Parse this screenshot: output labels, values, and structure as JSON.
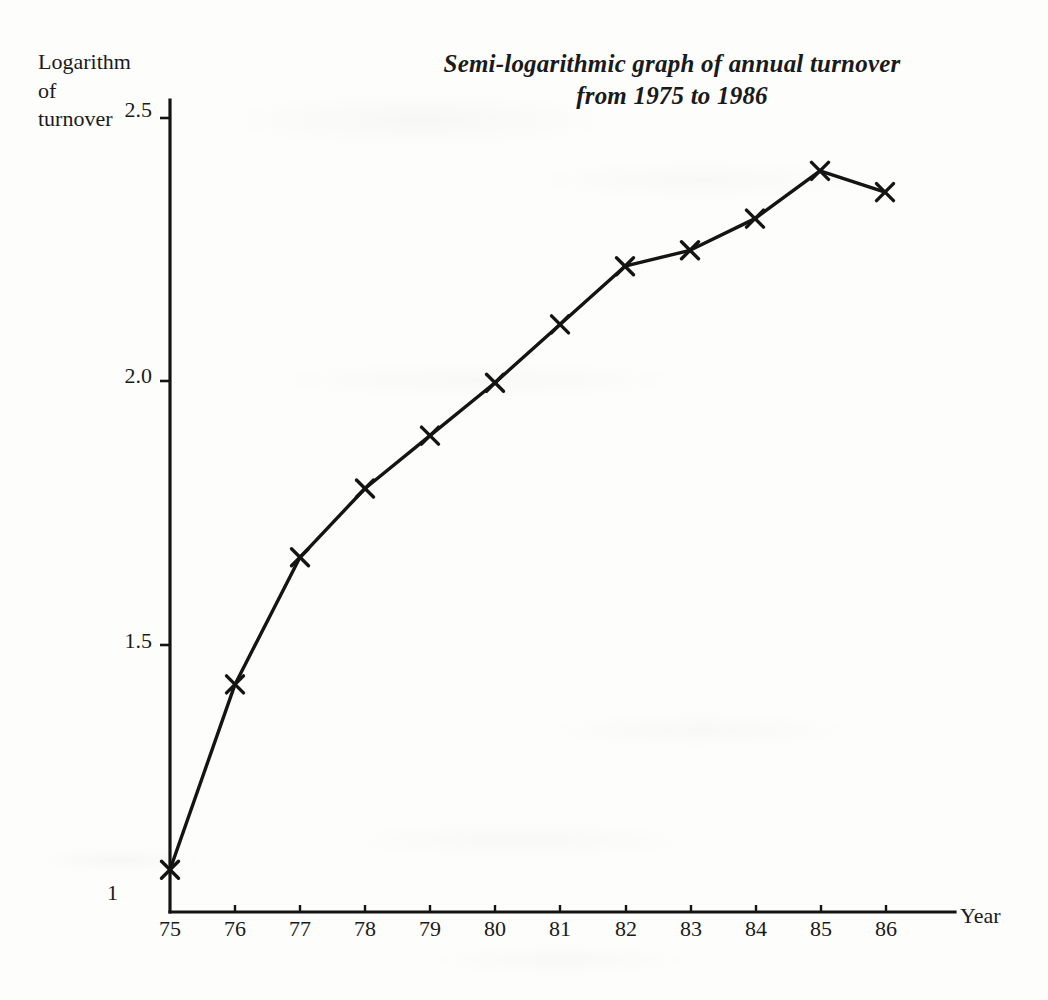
{
  "chart_data": {
    "type": "line",
    "title": "Semi-logarithmic graph of annual turnover from 1975 to 1986",
    "title_lines": [
      "Semi-logarithmic graph of annual turnover",
      "from 1975 to 1986"
    ],
    "xlabel": "Year",
    "ylabel": "Logarithm of turnover",
    "ylabel_lines": [
      "Logarithm",
      "of",
      "turnover"
    ],
    "categories": [
      "75",
      "76",
      "77",
      "78",
      "79",
      "80",
      "81",
      "82",
      "83",
      "84",
      "85",
      "86"
    ],
    "x": [
      1975,
      1976,
      1977,
      1978,
      1979,
      1980,
      1981,
      1982,
      1983,
      1984,
      1985,
      1986
    ],
    "values": [
      1.08,
      1.43,
      1.67,
      1.8,
      1.9,
      2.0,
      2.11,
      2.22,
      2.25,
      2.31,
      2.4,
      2.36
    ],
    "ylim": [
      1.0,
      2.58
    ],
    "xlim": [
      "75",
      "86"
    ],
    "y_ticks": [
      "1",
      "1.5",
      "2.0",
      "2.5"
    ],
    "y_tick_values": [
      1.0,
      1.5,
      2.0,
      2.5
    ],
    "x_ticks": [
      "75",
      "76",
      "77",
      "78",
      "79",
      "80",
      "81",
      "82",
      "83",
      "84",
      "85",
      "86"
    ],
    "grid": false,
    "legend": false,
    "marker": "x-cross",
    "line_color": "#141414",
    "axis_color": "#141414",
    "background_color": "#fdfdfc"
  }
}
